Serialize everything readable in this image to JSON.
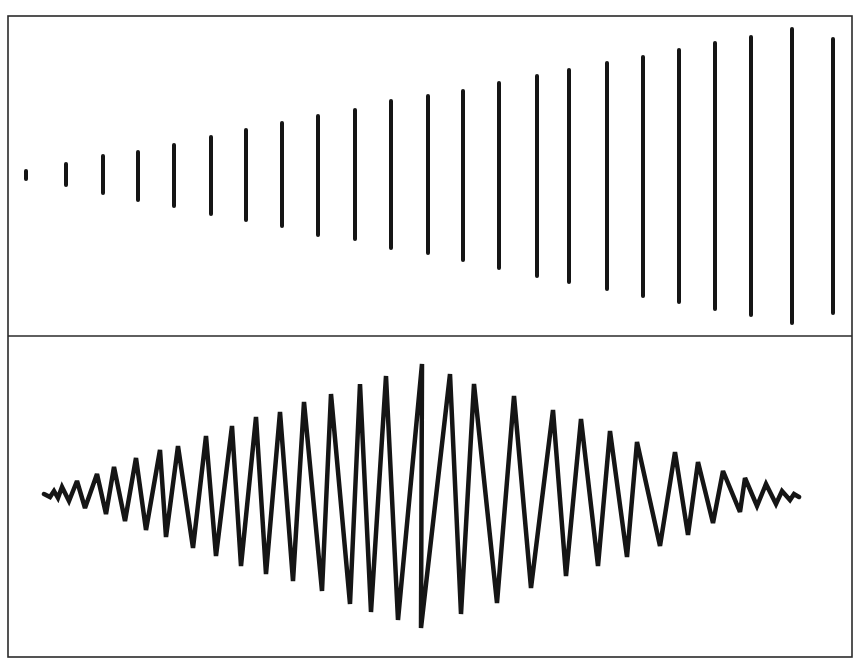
{
  "figure": {
    "colors": {
      "ink": "#151515",
      "frame": "#2a2a2a",
      "background": "#ffffff"
    },
    "frame": {
      "left": 8,
      "top": 16,
      "right": 852,
      "divider": 336,
      "bottom": 657
    },
    "top_panel": {
      "name": "increasing-amplitude-bars",
      "bars": [
        {
          "x": 26,
          "top": 171,
          "bottom": 179
        },
        {
          "x": 66,
          "top": 164,
          "bottom": 185
        },
        {
          "x": 103,
          "top": 156,
          "bottom": 193
        },
        {
          "x": 138,
          "top": 152,
          "bottom": 200
        },
        {
          "x": 174,
          "top": 145,
          "bottom": 206
        },
        {
          "x": 211,
          "top": 137,
          "bottom": 214
        },
        {
          "x": 246,
          "top": 130,
          "bottom": 220
        },
        {
          "x": 282,
          "top": 123,
          "bottom": 226
        },
        {
          "x": 318,
          "top": 116,
          "bottom": 235
        },
        {
          "x": 355,
          "top": 110,
          "bottom": 239
        },
        {
          "x": 391,
          "top": 101,
          "bottom": 248
        },
        {
          "x": 428,
          "top": 96,
          "bottom": 253
        },
        {
          "x": 463,
          "top": 91,
          "bottom": 260
        },
        {
          "x": 499,
          "top": 83,
          "bottom": 268
        },
        {
          "x": 537,
          "top": 76,
          "bottom": 276
        },
        {
          "x": 569,
          "top": 70,
          "bottom": 282
        },
        {
          "x": 607,
          "top": 63,
          "bottom": 289
        },
        {
          "x": 643,
          "top": 57,
          "bottom": 296
        },
        {
          "x": 679,
          "top": 50,
          "bottom": 302
        },
        {
          "x": 715,
          "top": 43,
          "bottom": 309
        },
        {
          "x": 751,
          "top": 37,
          "bottom": 315
        },
        {
          "x": 792,
          "top": 29,
          "bottom": 323
        },
        {
          "x": 833,
          "top": 39,
          "bottom": 313
        }
      ]
    },
    "bottom_panel": {
      "name": "modulated-zigzag-wave",
      "points": [
        [
          44,
          494
        ],
        [
          50,
          497
        ],
        [
          54,
          491
        ],
        [
          58,
          498
        ],
        [
          62,
          487
        ],
        [
          69,
          501
        ],
        [
          77,
          481
        ],
        [
          85,
          508
        ],
        [
          97,
          474
        ],
        [
          106,
          514
        ],
        [
          114,
          467
        ],
        [
          125,
          521
        ],
        [
          136,
          458
        ],
        [
          146,
          530
        ],
        [
          160,
          450
        ],
        [
          166,
          537
        ],
        [
          178,
          446
        ],
        [
          193,
          548
        ],
        [
          206,
          436
        ],
        [
          216,
          556
        ],
        [
          232,
          426
        ],
        [
          241,
          566
        ],
        [
          256,
          417
        ],
        [
          266,
          574
        ],
        [
          280,
          412
        ],
        [
          293,
          581
        ],
        [
          304,
          402
        ],
        [
          322,
          591
        ],
        [
          331,
          394
        ],
        [
          350,
          604
        ],
        [
          360,
          384
        ],
        [
          371,
          612
        ],
        [
          386,
          376
        ],
        [
          398,
          620
        ],
        [
          422,
          364
        ],
        [
          421,
          628
        ],
        [
          450,
          374
        ],
        [
          461,
          614
        ],
        [
          474,
          384
        ],
        [
          497,
          603
        ],
        [
          514,
          396
        ],
        [
          531,
          588
        ],
        [
          553,
          410
        ],
        [
          566,
          576
        ],
        [
          581,
          419
        ],
        [
          598,
          566
        ],
        [
          610,
          431
        ],
        [
          627,
          557
        ],
        [
          637,
          442
        ],
        [
          660,
          546
        ],
        [
          675,
          452
        ],
        [
          688,
          535
        ],
        [
          698,
          462
        ],
        [
          713,
          523
        ],
        [
          723,
          471
        ],
        [
          740,
          512
        ],
        [
          745,
          478
        ],
        [
          757,
          506
        ],
        [
          766,
          484
        ],
        [
          776,
          504
        ],
        [
          782,
          491
        ],
        [
          790,
          500
        ],
        [
          794,
          494
        ],
        [
          799,
          497
        ]
      ]
    }
  }
}
